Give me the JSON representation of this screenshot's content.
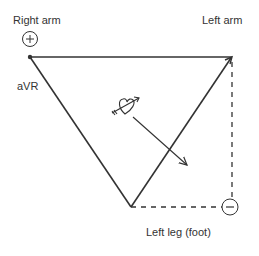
{
  "diagram": {
    "labels": {
      "right_arm": "Right arm",
      "left_arm": "Left arm",
      "avr": "aVR",
      "left_leg": "Left leg (foot)"
    },
    "electrodes": {
      "positive_symbol": "+",
      "negative_symbol": "−"
    },
    "icons": [
      "heart-with-arrow-icon",
      "vector-arrow-icon"
    ],
    "colors": {
      "line": "#333333",
      "background": "#ffffff"
    }
  }
}
